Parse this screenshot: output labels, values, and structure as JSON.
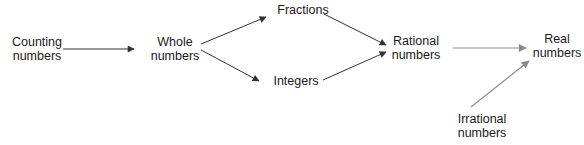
{
  "diagram": {
    "type": "flowchart",
    "direction": "left-to-right",
    "nodes": [
      {
        "id": "counting",
        "lines": [
          "Counting",
          "numbers"
        ],
        "x": 37,
        "y": 35
      },
      {
        "id": "whole",
        "lines": [
          "Whole",
          "numbers"
        ],
        "x": 175,
        "y": 35
      },
      {
        "id": "fractions",
        "lines": [
          "Fractions"
        ],
        "x": 303,
        "y": 3
      },
      {
        "id": "integers",
        "lines": [
          "Integers"
        ],
        "x": 296,
        "y": 74
      },
      {
        "id": "rational",
        "lines": [
          "Rational",
          "numbers"
        ],
        "x": 416,
        "y": 34
      },
      {
        "id": "real",
        "lines": [
          "Real",
          "numbers"
        ],
        "x": 557,
        "y": 32
      },
      {
        "id": "irrational",
        "lines": [
          "Irrational",
          "numbers"
        ],
        "x": 482,
        "y": 112
      }
    ],
    "edges": [
      {
        "from": "counting",
        "to": "whole",
        "x1": 63,
        "y1": 49,
        "x2": 134,
        "y2": 49,
        "color": "#333333"
      },
      {
        "from": "whole",
        "to": "fractions",
        "x1": 201,
        "y1": 44,
        "x2": 266,
        "y2": 17,
        "color": "#333333"
      },
      {
        "from": "whole",
        "to": "integers",
        "x1": 201,
        "y1": 50,
        "x2": 259,
        "y2": 81,
        "color": "#333333"
      },
      {
        "from": "fractions",
        "to": "rational",
        "x1": 324,
        "y1": 14,
        "x2": 386,
        "y2": 45,
        "color": "#333333"
      },
      {
        "from": "integers",
        "to": "rational",
        "x1": 323,
        "y1": 80,
        "x2": 386,
        "y2": 52,
        "color": "#333333"
      },
      {
        "from": "rational",
        "to": "real",
        "x1": 453,
        "y1": 48,
        "x2": 526,
        "y2": 48,
        "color": "#8a8a8a"
      },
      {
        "from": "irrational",
        "to": "real",
        "x1": 471,
        "y1": 107,
        "x2": 529,
        "y2": 61,
        "color": "#8a8a8a"
      }
    ]
  }
}
